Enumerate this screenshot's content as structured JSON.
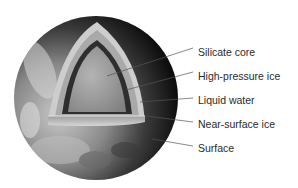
{
  "diagram": {
    "colors": {
      "background": "#ffffff",
      "surface_light": "#b8b8b8",
      "surface_dark": "#0c0c0c",
      "near_surface_ice": "#cfcfcf",
      "liquid_water": "#a6a6a6",
      "high_pressure_ice": "#2e2e2e",
      "silicate_core": "#9c9c9c",
      "leader_line": "#555555",
      "label_text": "#2a2a2a"
    },
    "labels": [
      {
        "text": "Silicate core",
        "top": 46
      },
      {
        "text": "High-pressure ice",
        "top": 70
      },
      {
        "text": "Liquid water",
        "top": 94
      },
      {
        "text": "Near-surface ice",
        "top": 118
      },
      {
        "text": "Surface",
        "top": 142
      }
    ]
  }
}
